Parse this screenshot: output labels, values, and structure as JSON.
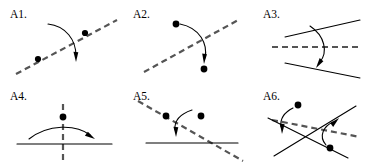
{
  "figure": {
    "background_color": "#ffffff",
    "ink_color": "#000000",
    "dashed_color": "#555555",
    "width": 370,
    "height": 165,
    "panel_count": 6
  },
  "panels": [
    {
      "id": "A1",
      "label": "A1.",
      "label_x": 10,
      "label_y": 18,
      "description": "Dashed diagonal line rising to the right with two dots on it and a curved arrow crossing downward",
      "dashed_lines": [
        {
          "x1": 16,
          "y1": 74,
          "x2": 117,
          "y2": 20
        }
      ],
      "solid_lines": [],
      "dots": [
        {
          "cx": 38,
          "cy": 59,
          "r": 3.1
        },
        {
          "cx": 85,
          "cy": 33,
          "r": 3.1
        }
      ],
      "arrows": [
        {
          "path": "M 48 24 C 66 26 76 40 76 56",
          "head_tip_x": 76,
          "head_tip_y": 62,
          "head_angle": 96
        }
      ]
    },
    {
      "id": "A2",
      "label": "A2.",
      "label_x": 133,
      "label_y": 18,
      "description": "Dashed diagonal line rising to the right with a dot above and a dot below joined by a curved arrow",
      "dashed_lines": [
        {
          "x1": 144,
          "y1": 72,
          "x2": 240,
          "y2": 19
        }
      ],
      "solid_lines": [],
      "dots": [
        {
          "cx": 176,
          "cy": 24,
          "r": 3.4
        },
        {
          "cx": 204,
          "cy": 69,
          "r": 3.4
        }
      ],
      "arrows": [
        {
          "path": "M 180 24 C 200 28 208 44 205 58",
          "head_tip_x": 204,
          "head_tip_y": 64,
          "head_angle": 100
        }
      ]
    },
    {
      "id": "A3",
      "label": "A3.",
      "label_x": 263,
      "label_y": 18,
      "description": "Two solid lines opening to the right with a horizontal dashed line between them and a curved arrow crossing downward",
      "dashed_lines": [
        {
          "x1": 272,
          "y1": 47,
          "x2": 360,
          "y2": 47
        }
      ],
      "solid_lines": [
        {
          "x1": 285,
          "y1": 37,
          "x2": 360,
          "y2": 20
        },
        {
          "x1": 285,
          "y1": 63,
          "x2": 360,
          "y2": 78
        }
      ],
      "dots": [],
      "arrows": [
        {
          "path": "M 310 26 C 325 36 328 52 320 62",
          "head_tip_x": 316,
          "head_tip_y": 68,
          "head_angle": 130
        }
      ]
    },
    {
      "id": "A4",
      "label": "A4.",
      "label_x": 10,
      "label_y": 100,
      "description": "Vertical dashed line through a horizontal solid line, a dot above the crossing and an arc arrow sweeping left to right",
      "dashed_lines": [
        {
          "x1": 63,
          "y1": 104,
          "x2": 63,
          "y2": 160
        }
      ],
      "solid_lines": [
        {
          "x1": 17,
          "y1": 144,
          "x2": 112,
          "y2": 144
        }
      ],
      "dots": [
        {
          "cx": 63,
          "cy": 117,
          "r": 3.4
        }
      ],
      "arrows": [
        {
          "path": "M 29 139 C 48 124 76 124 90 135",
          "head_tip_x": 95,
          "head_tip_y": 139,
          "head_angle": 38
        }
      ]
    },
    {
      "id": "A5",
      "label": "A5.",
      "label_x": 133,
      "label_y": 100,
      "description": "Dashed line descending to the right crossing a horizontal solid line, two dots above and a curved arrow pointing down",
      "dashed_lines": [
        {
          "x1": 138,
          "y1": 101,
          "x2": 243,
          "y2": 161
        }
      ],
      "solid_lines": [
        {
          "x1": 146,
          "y1": 143,
          "x2": 238,
          "y2": 143
        }
      ],
      "dots": [
        {
          "cx": 166,
          "cy": 116,
          "r": 3.4
        },
        {
          "cx": 201,
          "cy": 116,
          "r": 3.4
        }
      ],
      "arrows": [
        {
          "path": "M 192 110 C 180 114 174 120 175 130",
          "head_tip_x": 176,
          "head_tip_y": 137,
          "head_angle": 96
        }
      ]
    },
    {
      "id": "A6",
      "label": "A6.",
      "label_x": 263,
      "label_y": 100,
      "description": "Two crossing solid lines forming an X with a dashed line through them and two curved arrows each starting from a dot",
      "dashed_lines": [
        {
          "x1": 272,
          "y1": 120,
          "x2": 360,
          "y2": 137
        }
      ],
      "solid_lines": [
        {
          "x1": 268,
          "y1": 118,
          "x2": 348,
          "y2": 158
        },
        {
          "x1": 274,
          "y1": 156,
          "x2": 356,
          "y2": 106
        }
      ],
      "dots": [
        {
          "cx": 298,
          "cy": 105,
          "r": 3.4
        },
        {
          "cx": 330,
          "cy": 148,
          "r": 3.4
        }
      ],
      "arrows": [
        {
          "path": "M 293 108 C 283 113 280 120 281 127",
          "head_tip_x": 282,
          "head_tip_y": 134,
          "head_angle": 98
        },
        {
          "path": "M 326 145 C 318 136 324 126 333 122",
          "head_tip_x": 339,
          "head_tip_y": 118,
          "head_angle": -37
        }
      ]
    }
  ]
}
